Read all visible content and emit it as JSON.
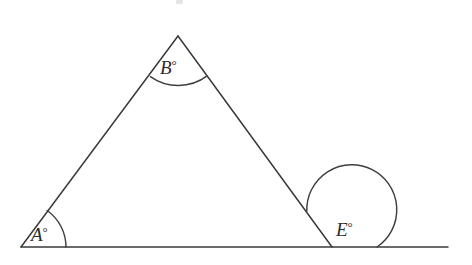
{
  "figure": {
    "background_color": "#ffffff",
    "stroke_color": "#3a3a3a",
    "label_color": "#2e2e2e",
    "degree_symbol": "°"
  },
  "labels": {
    "vertex_a": "A",
    "vertex_a_full": "A°",
    "vertex_b": "B",
    "vertex_b_full": "B°",
    "vertex_e": "E",
    "vertex_e_full": "E°"
  },
  "geometry": {
    "vertex_a": {
      "x": 21,
      "y": 247
    },
    "vertex_b": {
      "x": 178,
      "y": 36
    },
    "vertex_e": {
      "x": 332,
      "y": 247
    },
    "baseline_start": {
      "x": 21,
      "y": 247
    },
    "baseline_end": {
      "x": 448,
      "y": 247
    },
    "arc_a_radius": 45,
    "arc_b_radius": 48,
    "arc_e_radius": 45
  },
  "paths": {
    "left_leg": "M 21 247 L 178 36",
    "right_leg": "M 178 36 L 332 247",
    "baseline": "M 21 247 L 448 247",
    "arc_a": "M 66 247 A 45 45 0 0 0 47.2 210.5",
    "arc_b": "M 150.4 76.6 A 48 48 0 0 0 206.8 76.2",
    "arc_e": "M 377 247 A 45 45 0 1 0 306.8 211.3"
  },
  "label_positions": {
    "a": {
      "x": 31,
      "y": 241
    },
    "b": {
      "x": 160,
      "y": 74
    },
    "e": {
      "x": 336,
      "y": 236
    }
  },
  "artifact": {
    "present": true,
    "x": 176,
    "y": 0,
    "width": 7,
    "height": 4
  }
}
